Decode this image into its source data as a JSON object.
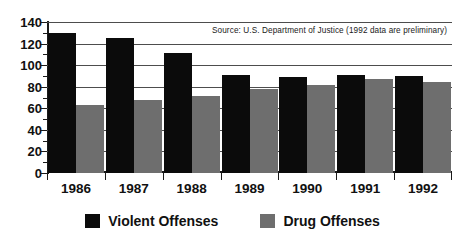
{
  "chart_data": {
    "type": "bar",
    "title": "",
    "subtitle": "",
    "xlabel": "",
    "ylabel": "",
    "categories": [
      "1986",
      "1987",
      "1988",
      "1989",
      "1990",
      "1991",
      "1992"
    ],
    "series": [
      {
        "name": "Violent Offenses",
        "color": "#0b0b0b",
        "values": [
          130,
          125,
          111,
          91,
          89,
          91,
          90
        ]
      },
      {
        "name": "Drug Offenses",
        "color": "#6e6e6e",
        "values": [
          63,
          68,
          71,
          78,
          82,
          87,
          84
        ]
      }
    ],
    "ylim": [
      0,
      140
    ],
    "yticks": [
      0,
      20,
      40,
      60,
      80,
      100,
      120,
      140
    ],
    "ytick_labels": [
      "0",
      "20",
      "40",
      "60",
      "80",
      "100",
      "120",
      "140"
    ],
    "grid": true,
    "grid_axis": "y",
    "legend_position": "bottom",
    "annotations": [
      "Source: U.S. Department of Justice (1992 data are preliminary)"
    ]
  },
  "source_note": "Source: U.S. Department of Justice (1992 data are preliminary)",
  "legend": {
    "items": [
      {
        "label": "Violent Offenses",
        "color": "#0b0b0b"
      },
      {
        "label": "Drug Offenses",
        "color": "#6e6e6e"
      }
    ]
  }
}
